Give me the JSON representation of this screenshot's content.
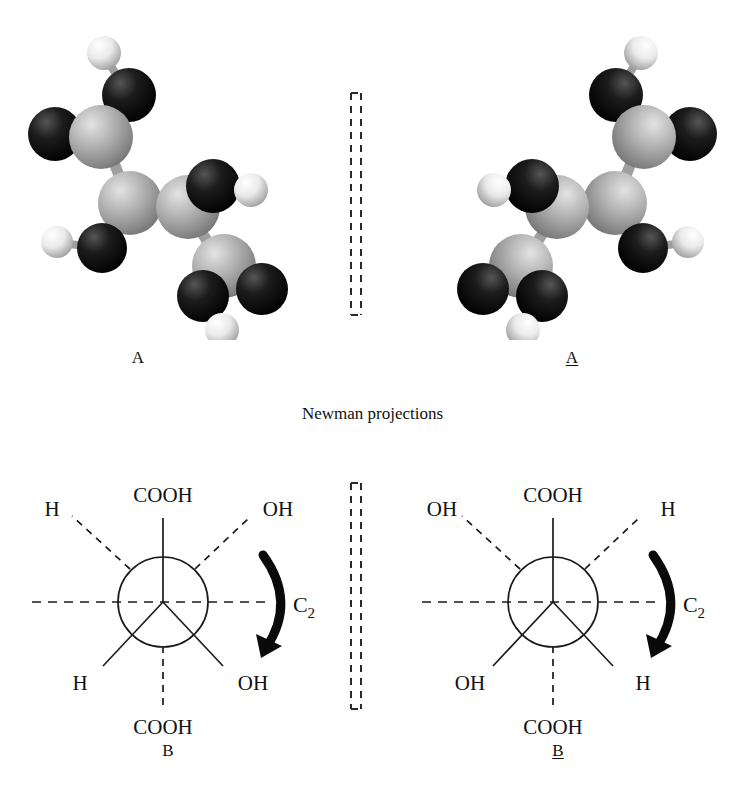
{
  "figure": {
    "caption": "Newman projections",
    "background_color": "#ffffff",
    "line_color": "#1a1a1a"
  },
  "molecules": {
    "left": {
      "label": "A",
      "underlined": false,
      "description": "ball-and-stick model of tartaric acid conformer A"
    },
    "right": {
      "label": "A",
      "underlined": true,
      "description": "ball-and-stick model of tartaric acid conformer A-prime (mirror image)"
    },
    "atom_colors": {
      "carbon": "#a6a6a6",
      "oxygen": "#141414",
      "hydrogen": "#f2f2f2",
      "bond": "#9a9a9a"
    }
  },
  "mirror_planes": [
    {
      "name": "upper-mirror-plane",
      "style": "dashed-bracket"
    },
    {
      "name": "lower-mirror-plane",
      "style": "dashed-bracket"
    }
  ],
  "newman_projections": {
    "left": {
      "label": "B",
      "underlined": false,
      "rotation_symbol": "C",
      "rotation_subscript": "2",
      "front_substituents": [
        {
          "position": "top",
          "label": "COOH",
          "bond": "solid"
        },
        {
          "position": "bottom-left",
          "label": "H",
          "bond": "solid"
        },
        {
          "position": "bottom-right",
          "label": "OH",
          "bond": "solid"
        }
      ],
      "back_substituents": [
        {
          "position": "top-left",
          "label": "H",
          "bond": "dashed"
        },
        {
          "position": "top-right",
          "label": "OH",
          "bond": "dashed"
        },
        {
          "position": "bottom",
          "label": "COOH",
          "bond": "dashed"
        }
      ]
    },
    "right": {
      "label": "B",
      "underlined": true,
      "rotation_symbol": "C",
      "rotation_subscript": "2",
      "front_substituents": [
        {
          "position": "top",
          "label": "COOH",
          "bond": "solid"
        },
        {
          "position": "bottom-left",
          "label": "OH",
          "bond": "solid"
        },
        {
          "position": "bottom-right",
          "label": "H",
          "bond": "solid"
        }
      ],
      "back_substituents": [
        {
          "position": "top-left",
          "label": "OH",
          "bond": "dashed"
        },
        {
          "position": "top-right",
          "label": "H",
          "bond": "dashed"
        },
        {
          "position": "bottom",
          "label": "COOH",
          "bond": "dashed"
        }
      ]
    }
  }
}
